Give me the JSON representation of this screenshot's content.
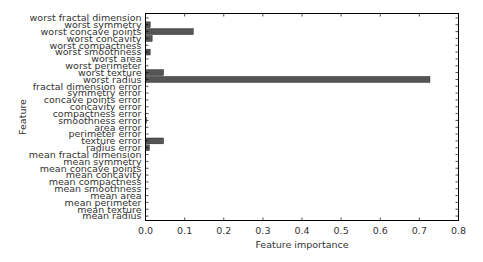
{
  "chart_data": {
    "type": "bar",
    "orientation": "horizontal",
    "title": "",
    "xlabel": "Feature importance",
    "ylabel": "Feature",
    "xlim": [
      0.0,
      0.8
    ],
    "xticks": [
      "0.0",
      "0.1",
      "0.2",
      "0.3",
      "0.4",
      "0.5",
      "0.6",
      "0.7",
      "0.8"
    ],
    "grid": false,
    "legend": null,
    "bar_color": "#555555",
    "categories": [
      "mean radius",
      "mean texture",
      "mean perimeter",
      "mean area",
      "mean smoothness",
      "mean compactness",
      "mean concavity",
      "mean concave points",
      "mean symmetry",
      "mean fractal dimension",
      "radius error",
      "texture error",
      "perimeter error",
      "area error",
      "smoothness error",
      "compactness error",
      "concavity error",
      "concave points error",
      "symmetry error",
      "fractal dimension error",
      "worst radius",
      "worst texture",
      "worst perimeter",
      "worst area",
      "worst smoothness",
      "worst compactness",
      "worst concavity",
      "worst concave points",
      "worst symmetry",
      "worst fractal dimension"
    ],
    "values": [
      0.0,
      0.0,
      0.0,
      0.0,
      0.0,
      0.0,
      0.0,
      0.0,
      0.0,
      0.0,
      0.01,
      0.046,
      0.0,
      0.0,
      0.002,
      0.0,
      0.0,
      0.0,
      0.0,
      0.0,
      0.727,
      0.046,
      0.0,
      0.0,
      0.012,
      0.0,
      0.017,
      0.122,
      0.012,
      0.0
    ]
  }
}
